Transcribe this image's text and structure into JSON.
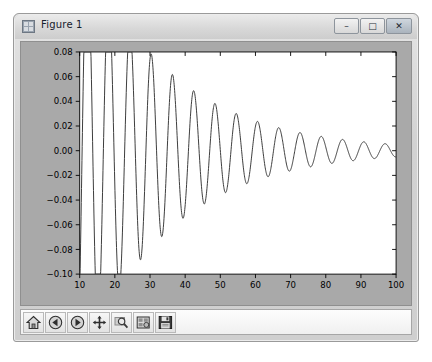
{
  "window": {
    "title": "Figure 1",
    "icon": "figure-grid-icon",
    "controls": {
      "minimize": "–",
      "maximize": "□",
      "close": "✕"
    }
  },
  "toolbar": {
    "buttons": [
      {
        "name": "home",
        "label": "Home",
        "icon": "house-icon"
      },
      {
        "name": "back",
        "label": "Back",
        "icon": "back-arrow-icon"
      },
      {
        "name": "forward",
        "label": "Forward",
        "icon": "forward-arrow-icon"
      },
      {
        "name": "pan",
        "label": "Pan",
        "icon": "move-cross-icon"
      },
      {
        "name": "zoom",
        "label": "Zoom to rectangle",
        "icon": "magnifier-icon"
      },
      {
        "name": "configure",
        "label": "Configure subplots",
        "icon": "subplots-icon"
      },
      {
        "name": "save",
        "label": "Save the figure",
        "icon": "floppy-disk-icon"
      }
    ]
  },
  "colors": {
    "figure_face": "#a9a9a9",
    "axes_face": "#ffffff",
    "line": "#3c3c3c",
    "window_frame": "#d6d6d6"
  },
  "chart_data": {
    "type": "line",
    "title": "",
    "xlabel": "",
    "ylabel": "",
    "xlim": [
      10,
      100
    ],
    "ylim": [
      -0.1,
      0.08
    ],
    "grid": false,
    "legend": null,
    "xticks": [
      10,
      20,
      30,
      40,
      50,
      60,
      70,
      80,
      90,
      100
    ],
    "yticks": [
      0.08,
      0.06,
      0.04,
      0.02,
      0.0,
      -0.02,
      -0.04,
      -0.06,
      -0.08,
      -0.1
    ],
    "xticklabels": [
      "10",
      "20",
      "30",
      "40",
      "50",
      "60",
      "70",
      "80",
      "90",
      "100"
    ],
    "yticklabels": [
      "0.08",
      "0.06",
      "0.04",
      "0.02",
      "0.00",
      "−0.02",
      "−0.04",
      "−0.06",
      "−0.08",
      "−0.10"
    ],
    "series": [
      {
        "name": "damped oscillation",
        "color": "#3c3c3c",
        "linewidth": 1,
        "description": "Exponentially decaying sinusoid: amplitude falls from about 0.08 near x=12 to about 0.008 at x=100; period is approximately 6 x-units; curve begins at x=10 near y=-0.065.",
        "model": {
          "amplitude": 0.26,
          "decay": 0.0395,
          "period": 6.05,
          "phase_x0": 12.2,
          "offset": 0.0
        },
        "sample_points": [
          [
            10.0,
            -0.065
          ],
          [
            11.0,
            0.03
          ],
          [
            12.2,
            0.08
          ],
          [
            13.5,
            0.02
          ],
          [
            15.2,
            -0.062
          ],
          [
            16.8,
            -0.01
          ],
          [
            18.6,
            0.058
          ],
          [
            20.0,
            0.015
          ],
          [
            21.4,
            -0.05
          ],
          [
            23.0,
            -0.008
          ],
          [
            24.8,
            0.049
          ],
          [
            26.2,
            0.012
          ],
          [
            27.6,
            -0.042
          ],
          [
            29.2,
            -0.006
          ],
          [
            30.9,
            0.041
          ],
          [
            32.3,
            0.01
          ],
          [
            33.8,
            -0.035
          ],
          [
            35.4,
            -0.005
          ],
          [
            37.0,
            0.035
          ],
          [
            38.5,
            0.008
          ],
          [
            40.0,
            -0.03
          ],
          [
            41.6,
            -0.004
          ],
          [
            43.2,
            0.03
          ],
          [
            44.6,
            0.007
          ],
          [
            46.1,
            -0.026
          ],
          [
            47.7,
            -0.004
          ],
          [
            49.3,
            0.026
          ],
          [
            50.7,
            0.006
          ],
          [
            52.3,
            -0.022
          ],
          [
            53.9,
            -0.003
          ],
          [
            55.4,
            0.022
          ],
          [
            56.9,
            0.005
          ],
          [
            58.4,
            -0.019
          ],
          [
            60.0,
            -0.003
          ],
          [
            61.5,
            0.019
          ],
          [
            63.0,
            0.004
          ],
          [
            64.5,
            -0.016
          ],
          [
            66.1,
            -0.002
          ],
          [
            67.6,
            0.016
          ],
          [
            69.1,
            0.004
          ],
          [
            70.7,
            -0.014
          ],
          [
            72.2,
            -0.002
          ],
          [
            73.8,
            0.014
          ],
          [
            75.2,
            0.003
          ],
          [
            76.8,
            -0.012
          ],
          [
            78.3,
            -0.002
          ],
          [
            79.9,
            0.012
          ],
          [
            81.4,
            0.003
          ],
          [
            82.9,
            -0.01
          ],
          [
            84.5,
            -0.002
          ],
          [
            86.0,
            0.01
          ],
          [
            87.5,
            0.002
          ],
          [
            89.1,
            -0.009
          ],
          [
            90.6,
            -0.001
          ],
          [
            92.2,
            0.009
          ],
          [
            93.6,
            0.002
          ],
          [
            95.2,
            -0.008
          ],
          [
            96.7,
            -0.001
          ],
          [
            98.3,
            0.008
          ],
          [
            100.0,
            0.005
          ]
        ]
      }
    ]
  }
}
